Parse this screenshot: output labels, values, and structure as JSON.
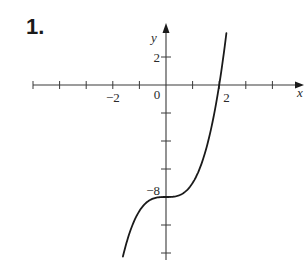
{
  "problem": {
    "number_label": "1."
  },
  "chart_data": {
    "type": "line",
    "title": "",
    "function_hint": "y = x^3 - 8",
    "xlabel": "x",
    "ylabel": "y",
    "xlim": [
      -5,
      5.1
    ],
    "ylim": [
      -12.5,
      6
    ],
    "grid": false,
    "legend": null,
    "x_ticks": [
      -5,
      -4,
      -3,
      -2,
      -1,
      1,
      2,
      3,
      4
    ],
    "x_tick_labels": [
      {
        "value": -2,
        "text": "−2"
      },
      {
        "value": 0,
        "text": "0"
      },
      {
        "value": 2,
        "text": "2"
      }
    ],
    "y_ticks": [
      2,
      -2,
      -4,
      -6,
      -8,
      -10,
      -12
    ],
    "y_tick_labels": [
      {
        "value": 2,
        "text": "2"
      },
      {
        "value": -8,
        "text": "−8"
      }
    ],
    "series": [
      {
        "name": "curve",
        "x": [
          -1.6,
          -1.4,
          -1.2,
          -1.0,
          -0.8,
          -0.6,
          -0.4,
          -0.2,
          0,
          0.2,
          0.4,
          0.6,
          0.8,
          1.0,
          1.2,
          1.4,
          1.6,
          1.8,
          2.0,
          2.2,
          2.25
        ],
        "y": [
          -12.1,
          -10.74,
          -9.73,
          -9.0,
          -8.51,
          -8.22,
          -8.06,
          -8.01,
          -8.0,
          -7.99,
          -7.94,
          -7.78,
          -7.49,
          -7.0,
          -6.27,
          -5.26,
          -3.9,
          -2.17,
          0.0,
          2.65,
          3.39
        ]
      }
    ],
    "key_points": [
      {
        "x": 0,
        "y": -8,
        "note": "inflection point / y-intercept"
      },
      {
        "x": 2,
        "y": 0,
        "note": "x-intercept"
      }
    ]
  }
}
